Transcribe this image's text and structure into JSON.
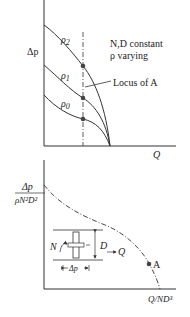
{
  "top_chart": {
    "y_label": "Δp",
    "x_label": "Q",
    "annotation_line1": "N,D constant",
    "annotation_line2": "ρ varying",
    "locus_label": "Locus of A",
    "curves": [
      {
        "label": "ρ2",
        "sub": "2"
      },
      {
        "label": "ρ1",
        "sub": "1"
      },
      {
        "label": "ρ0",
        "sub": "0"
      }
    ]
  },
  "bottom_chart": {
    "y_label_num": "Δp",
    "y_label_den": "ρN²D²",
    "x_label": "Q/ND³",
    "point_label": "A",
    "inset": {
      "speed_label": "N",
      "diameter_label": "D",
      "flow_label": "Q",
      "pressure_label": "Δp"
    }
  },
  "colors": {
    "line": "#333333",
    "dot": "#444444"
  }
}
